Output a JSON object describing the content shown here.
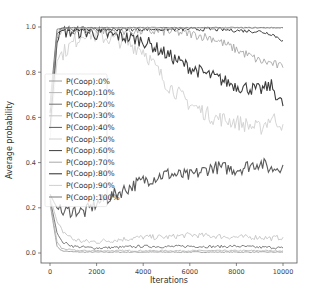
{
  "chart_data": {
    "type": "line",
    "title": "",
    "xlabel": "Iterations",
    "ylabel": "Average probability",
    "xlim": [
      -400,
      10400
    ],
    "ylim": [
      -0.05,
      1.05
    ],
    "xticks": [
      0,
      2000,
      4000,
      6000,
      8000,
      10000
    ],
    "xtick_labels": [
      "0",
      "2000",
      "4000",
      "6000",
      "8000",
      "10000"
    ],
    "yticks": [
      0.0,
      0.2,
      0.4,
      0.6,
      0.8,
      1.0
    ],
    "ytick_labels": [
      "0.0",
      "0.2",
      "0.4",
      "0.6",
      "0.8",
      "1.0"
    ],
    "grid": false,
    "legend_position": "center left",
    "x": [
      0,
      300,
      500,
      1000,
      1500,
      2000,
      3000,
      4000,
      5000,
      6000,
      7000,
      8000,
      9000,
      9500,
      10000
    ],
    "series": [
      {
        "name": "P(Coop):0%",
        "color": "#9a9a9a",
        "values": [
          0.22,
          0.03,
          0.01,
          0.005,
          0.004,
          0.004,
          0.004,
          0.004,
          0.004,
          0.004,
          0.004,
          0.004,
          0.004,
          0.004,
          0.004
        ]
      },
      {
        "name": "P(Coop):10%",
        "color": "#b5b5b5",
        "values": [
          0.23,
          0.05,
          0.02,
          0.012,
          0.01,
          0.01,
          0.01,
          0.01,
          0.01,
          0.01,
          0.01,
          0.01,
          0.01,
          0.01,
          0.01
        ]
      },
      {
        "name": "P(Coop):20%",
        "color": "#6e6e6e",
        "values": [
          0.24,
          0.09,
          0.05,
          0.03,
          0.025,
          0.022,
          0.025,
          0.03,
          0.028,
          0.03,
          0.028,
          0.03,
          0.025,
          0.025,
          0.022
        ]
      },
      {
        "name": "P(Coop):30%",
        "color": "#c4c4c4",
        "values": [
          0.25,
          0.14,
          0.1,
          0.06,
          0.05,
          0.05,
          0.06,
          0.07,
          0.07,
          0.08,
          0.075,
          0.07,
          0.07,
          0.065,
          0.07
        ]
      },
      {
        "name": "P(Coop):40%",
        "color": "#5a5a5a",
        "values": [
          0.26,
          0.2,
          0.18,
          0.19,
          0.18,
          0.22,
          0.27,
          0.32,
          0.35,
          0.34,
          0.38,
          0.37,
          0.4,
          0.37,
          0.39
        ]
      },
      {
        "name": "P(Coop):50%",
        "color": "#d0d0d0",
        "values": [
          0.5,
          0.85,
          0.88,
          0.93,
          0.98,
          0.96,
          0.94,
          0.9,
          0.75,
          0.66,
          0.6,
          0.58,
          0.55,
          0.6,
          0.57
        ]
      },
      {
        "name": "P(Coop):60%",
        "color": "#3c3c3c",
        "values": [
          0.55,
          0.93,
          0.98,
          0.98,
          0.98,
          0.97,
          0.96,
          0.94,
          0.88,
          0.82,
          0.78,
          0.74,
          0.72,
          0.74,
          0.65
        ]
      },
      {
        "name": "P(Coop):70%",
        "color": "#a8a8a8",
        "values": [
          0.6,
          0.95,
          0.98,
          0.985,
          0.985,
          0.985,
          0.985,
          0.98,
          0.98,
          0.97,
          0.95,
          0.9,
          0.85,
          0.84,
          0.82
        ]
      },
      {
        "name": "P(Coop):80%",
        "color": "#2a2a2a",
        "values": [
          0.62,
          0.97,
          0.99,
          0.99,
          0.99,
          0.99,
          0.99,
          0.99,
          0.99,
          0.99,
          0.99,
          0.985,
          0.98,
          0.97,
          0.94
        ]
      },
      {
        "name": "P(Coop):90%",
        "color": "#cfcfcf",
        "values": [
          0.64,
          0.98,
          0.99,
          0.995,
          0.995,
          0.995,
          0.995,
          0.995,
          0.995,
          0.995,
          0.995,
          0.995,
          0.995,
          0.995,
          0.995
        ]
      },
      {
        "name": "P(Coop):100%",
        "color": "#7a7a7a",
        "values": [
          0.66,
          0.99,
          0.995,
          0.997,
          0.997,
          0.997,
          0.997,
          0.997,
          0.997,
          0.997,
          0.997,
          0.997,
          0.997,
          0.997,
          0.997
        ]
      }
    ]
  },
  "layout": {
    "plot_left": 41,
    "plot_right": 297,
    "plot_top": 17,
    "plot_bottom": 263,
    "x0_px": 50,
    "x10000_px": 283,
    "y0_px": 253,
    "y1_px": 27
  }
}
